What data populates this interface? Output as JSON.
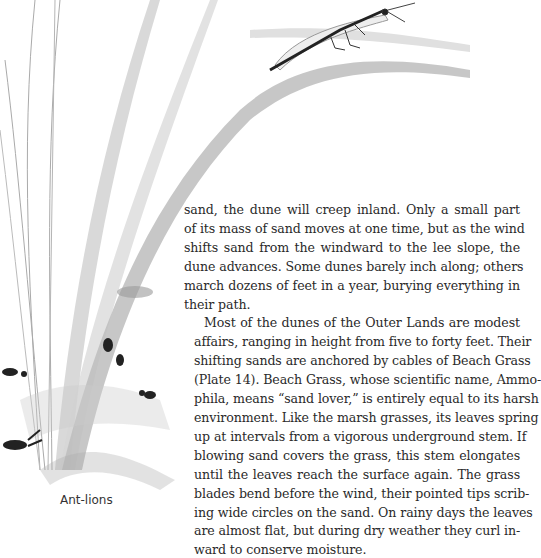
{
  "page": {
    "paragraphs": [
      {
        "indent": false,
        "lines": [
          "sand, the dune will creep inland. Only a small part",
          "of its mass of sand moves at one time, but as the wind",
          "shifts sand from the windward to the lee slope, the",
          "dune advances. Some dunes barely inch along; others",
          "march dozens of feet in a year, burying everything in",
          "their path."
        ]
      },
      {
        "indent": true,
        "lines": [
          "Most of the dunes of the Outer Lands are modest",
          "affairs, ranging in height from five to forty feet. Their",
          "shifting sands are anchored by cables of Beach Grass",
          "(Plate 14). Beach Grass, whose scientific name, Ammo-",
          "phila, means “sand lover,” is entirely equal to its harsh",
          "environment. Like the marsh grasses, its leaves spring",
          "up at intervals from a vigorous underground stem. If",
          "blowing sand covers the grass, this stem elongates",
          "until the leaves reach the surface again. The grass",
          "blades bend before the wind, their pointed tips scrib-",
          "ing wide circles on the sand. On rainy days the leaves",
          "are almost flat, but during dry weather they curl in-",
          "ward to conserve moisture."
        ]
      }
    ],
    "illustration": {
      "subject": "Beach grass blades with ant-lion adult, ants and ant-lion pits in sand",
      "caption": "Ant-lions"
    }
  }
}
